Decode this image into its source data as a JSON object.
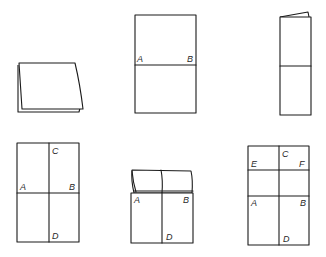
{
  "diagram": {
    "type": "paper-folding-steps",
    "background": "#ffffff",
    "stroke_color": "#1a1a1a",
    "figures": [
      {
        "id": "fig1",
        "description": "paper folded in half (angled view)",
        "labels": []
      },
      {
        "id": "fig2",
        "description": "unfolded sheet with horizontal crease",
        "labels": [
          {
            "text": "A"
          },
          {
            "text": "B"
          }
        ]
      },
      {
        "id": "fig3",
        "description": "sheet folded lengthwise with top flap",
        "labels": []
      },
      {
        "id": "fig4",
        "description": "sheet with horizontal and vertical creases",
        "labels": [
          {
            "text": "C"
          },
          {
            "text": "A"
          },
          {
            "text": "B"
          },
          {
            "text": "D"
          }
        ]
      },
      {
        "id": "fig5",
        "description": "top portion folded down along A-B",
        "labels": [
          {
            "text": "A"
          },
          {
            "text": "B"
          },
          {
            "text": "D"
          }
        ]
      },
      {
        "id": "fig6",
        "description": "sheet with creases A-B, E-F and C-D",
        "labels": [
          {
            "text": "C"
          },
          {
            "text": "E"
          },
          {
            "text": "F"
          },
          {
            "text": "A"
          },
          {
            "text": "B"
          },
          {
            "text": "D"
          }
        ]
      }
    ]
  }
}
